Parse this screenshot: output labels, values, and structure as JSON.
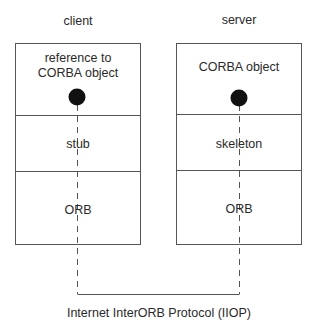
{
  "diagram": {
    "client": {
      "header": "client",
      "layers": [
        "reference to\nCORBA object",
        "stub",
        "ORB"
      ]
    },
    "server": {
      "header": "server",
      "layers": [
        "CORBA object",
        "skeleton",
        "ORB"
      ]
    },
    "protocol_label": "Internet InterORB Protocol (IIOP)"
  }
}
